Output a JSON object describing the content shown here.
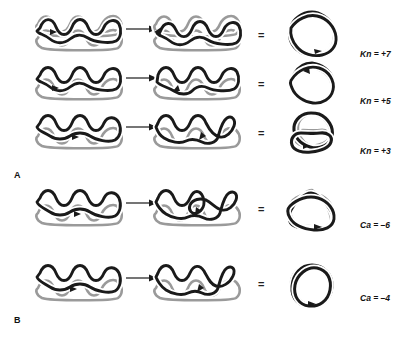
{
  "figure": {
    "background": "#ffffff",
    "strand_colors": {
      "black": "#1a1a1a",
      "gray": "#9a9a9a"
    },
    "equals_symbol": "=",
    "arrow_symbol": "→"
  },
  "panels": [
    {
      "id": "A",
      "letter": "A",
      "rows": [
        {
          "id": "row-kn7",
          "left_diagram": "braid-4-node-substrate",
          "mid_diagram": "braid-4-node-recombined",
          "right_diagram": "seven-crossing-star-knot",
          "label": "Kn = +7",
          "label_symbol": "Kn",
          "label_value": "+7",
          "crossings": 7
        },
        {
          "id": "row-kn5",
          "left_diagram": "braid-3-node-substrate",
          "mid_diagram": "braid-3-node-recombined",
          "right_diagram": "five-crossing-star-knot",
          "label": "Kn = +5",
          "label_symbol": "Kn",
          "label_value": "+5",
          "crossings": 5
        },
        {
          "id": "row-kn3",
          "left_diagram": "braid-2-node-substrate",
          "mid_diagram": "braid-2-node-recombined",
          "right_diagram": "trefoil-knot",
          "label": "Kn = +3",
          "label_symbol": "Kn",
          "label_value": "+3",
          "crossings": 3
        }
      ]
    },
    {
      "id": "B",
      "letter": "B",
      "rows": [
        {
          "id": "row-ca6",
          "left_diagram": "braid-3-node-catenane-substrate",
          "mid_diagram": "braid-3-node-catenane-recombined",
          "right_diagram": "six-crossing-catenane",
          "label": "Ca = –6",
          "label_symbol": "Ca",
          "label_value": "–6",
          "crossings": 6
        },
        {
          "id": "row-ca4",
          "left_diagram": "braid-2-node-catenane-substrate",
          "mid_diagram": "braid-2-node-catenane-recombined",
          "right_diagram": "four-crossing-catenane",
          "label": "Ca = –4",
          "label_symbol": "Ca",
          "label_value": "–4",
          "crossings": 4
        }
      ]
    }
  ]
}
